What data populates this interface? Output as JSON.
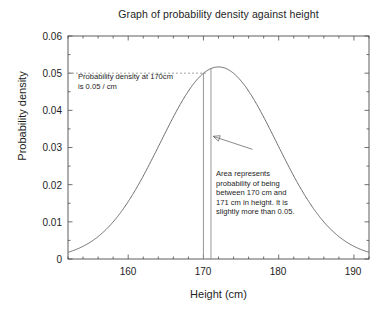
{
  "chart_data": {
    "type": "line",
    "title": "Graph of probability density against height",
    "xlabel": "Height (cm)",
    "ylabel": "Probability density",
    "xlim": [
      152,
      192
    ],
    "ylim": [
      0,
      0.06
    ],
    "grid": false,
    "legend": null,
    "distribution": {
      "family": "normal",
      "mean": 172.0,
      "sigma": 7.72,
      "peak_value": 0.0517,
      "peak_x": 172.0
    },
    "x_tick_labels": [
      "160",
      "170",
      "180",
      "190"
    ],
    "x_tick_values": [
      160,
      170,
      180,
      190
    ],
    "x_minor_tick_step": 2,
    "y_tick_labels": [
      "0",
      "0.01",
      "0.02",
      "0.03",
      "0.04",
      "0.05",
      "0.06"
    ],
    "y_tick_values": [
      0,
      0.01,
      0.02,
      0.03,
      0.04,
      0.05,
      0.06
    ],
    "series": [
      {
        "name": "probability density",
        "color": "#6b6b6b",
        "x": [
          152,
          154,
          156,
          158,
          160,
          162,
          164,
          166,
          168,
          170,
          171,
          172,
          174,
          176,
          178,
          180,
          182,
          184,
          186,
          188,
          190,
          192
        ],
        "values": [
          0.0025,
          0.0045,
          0.0076,
          0.0119,
          0.0174,
          0.024,
          0.0312,
          0.0383,
          0.0445,
          0.049,
          0.0505,
          0.0517,
          0.0511,
          0.0477,
          0.0422,
          0.0352,
          0.0277,
          0.0206,
          0.0144,
          0.0095,
          0.0059,
          0.0034
        ]
      }
    ],
    "markers": {
      "vertical_lines": [
        {
          "name": "line-170",
          "x": 170,
          "y_top": 0.049
        },
        {
          "name": "line-171",
          "x": 171,
          "y_top": 0.0505
        }
      ],
      "dashed_horizontal_line": {
        "y": 0.05,
        "x_from": 152,
        "x_to": 170.5
      },
      "arrow": {
        "from_x": 176.5,
        "from_y": 0.0295,
        "to_x": 171.3,
        "to_y": 0.033
      }
    },
    "annotations": [
      {
        "name": "annotation-density",
        "lines": [
          "Probability density at 170cm",
          "is 0.05 / cm"
        ]
      },
      {
        "name": "annotation-area",
        "lines": [
          "Area represents",
          "probability of being",
          "between 170 cm and",
          "171 cm in height. It is",
          "slightly more than 0.05."
        ]
      }
    ]
  },
  "colors": {
    "background": "#ffffff",
    "axis": "#4d4d4d",
    "curve": "#6b6b6b",
    "marker_line": "#8c8c8c",
    "text": "#1d1d1d"
  }
}
